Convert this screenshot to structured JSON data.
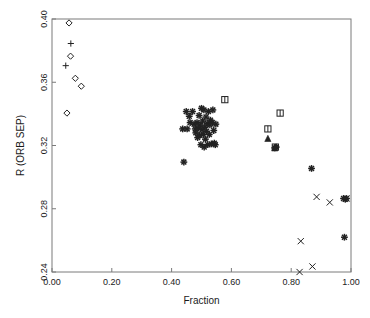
{
  "figure": {
    "faint_header": "",
    "background": "#ffffff",
    "marker_color": "#222222",
    "axis_color": "#7a7a7a"
  },
  "chart_data": {
    "type": "scatter",
    "title": "",
    "xlabel": "Fraction",
    "ylabel": "R (ORB SEP)",
    "xlim": [
      0.0,
      1.0
    ],
    "ylim": [
      0.24,
      0.4
    ],
    "xticks": [
      0.0,
      0.2,
      0.4,
      0.6,
      0.8,
      1.0
    ],
    "xticklabels": [
      "0.00",
      "0.20",
      "0.40",
      "0.60",
      "0.80",
      "1.00"
    ],
    "yticks": [
      0.24,
      0.28,
      0.32,
      0.36,
      0.4
    ],
    "yticklabels": [
      "0.24",
      "0.28",
      "0.32",
      "0.36",
      "0.40"
    ],
    "grid": false,
    "legend": null,
    "series": [
      {
        "name": "diamond",
        "marker": "diamond",
        "points": [
          [
            0.057,
            0.3975
          ],
          [
            0.062,
            0.3765
          ],
          [
            0.078,
            0.3625
          ],
          [
            0.098,
            0.3575
          ],
          [
            0.05,
            0.3405
          ]
        ]
      },
      {
        "name": "plus",
        "marker": "plus",
        "points": [
          [
            0.063,
            0.3845
          ],
          [
            0.046,
            0.3705
          ]
        ]
      },
      {
        "name": "asterisk",
        "marker": "asterisk",
        "points": [
          [
            0.437,
            0.3305
          ],
          [
            0.441,
            0.3095
          ],
          [
            0.449,
            0.3415
          ],
          [
            0.452,
            0.3305
          ],
          [
            0.459,
            0.3385
          ],
          [
            0.462,
            0.3345
          ],
          [
            0.47,
            0.3415
          ],
          [
            0.475,
            0.3335
          ],
          [
            0.479,
            0.3305
          ],
          [
            0.481,
            0.328
          ],
          [
            0.485,
            0.3345
          ],
          [
            0.487,
            0.325
          ],
          [
            0.49,
            0.331
          ],
          [
            0.492,
            0.339
          ],
          [
            0.494,
            0.3265
          ],
          [
            0.496,
            0.333
          ],
          [
            0.498,
            0.3205
          ],
          [
            0.5,
            0.3435
          ],
          [
            0.502,
            0.33
          ],
          [
            0.504,
            0.3355
          ],
          [
            0.506,
            0.327
          ],
          [
            0.508,
            0.3425
          ],
          [
            0.509,
            0.319
          ],
          [
            0.511,
            0.3315
          ],
          [
            0.513,
            0.324
          ],
          [
            0.515,
            0.338
          ],
          [
            0.517,
            0.329
          ],
          [
            0.519,
            0.334
          ],
          [
            0.521,
            0.3205
          ],
          [
            0.523,
            0.3415
          ],
          [
            0.526,
            0.327
          ],
          [
            0.528,
            0.333
          ],
          [
            0.53,
            0.336
          ],
          [
            0.533,
            0.321
          ],
          [
            0.536,
            0.3345
          ],
          [
            0.538,
            0.3425
          ],
          [
            0.541,
            0.3295
          ],
          [
            0.543,
            0.3215
          ],
          [
            0.546,
            0.3205
          ],
          [
            0.548,
            0.3335
          ],
          [
            0.745,
            0.3185
          ],
          [
            0.75,
            0.319
          ],
          [
            0.868,
            0.3055
          ],
          [
            0.975,
            0.2865
          ],
          [
            0.981,
            0.286
          ],
          [
            0.985,
            0.2865
          ],
          [
            0.978,
            0.262
          ]
        ]
      },
      {
        "name": "square",
        "marker": "square",
        "points": [
          [
            0.578,
            0.349
          ],
          [
            0.722,
            0.3305
          ],
          [
            0.763,
            0.3405
          ],
          [
            0.747,
            0.319
          ]
        ]
      },
      {
        "name": "triangle",
        "marker": "triangle",
        "points": [
          [
            0.722,
            0.3245
          ],
          [
            0.745,
            0.3185
          ]
        ]
      },
      {
        "name": "cross",
        "marker": "cross",
        "points": [
          [
            0.832,
            0.2595
          ],
          [
            0.828,
            0.24
          ],
          [
            0.871,
            0.2435
          ],
          [
            0.885,
            0.2875
          ],
          [
            0.929,
            0.284
          ],
          [
            0.985,
            0.2865
          ]
        ]
      }
    ]
  }
}
